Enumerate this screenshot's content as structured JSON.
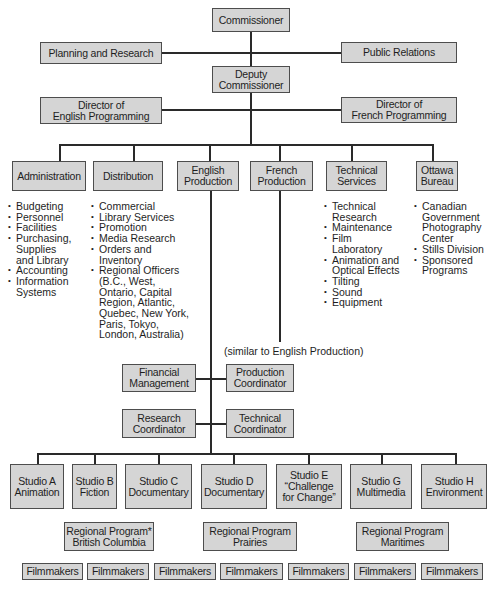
{
  "top": {
    "commissioner": "Commissioner",
    "planning": "Planning and Research",
    "public_relations": "Public Relations",
    "deputy": "Deputy\nCommissioner",
    "director_english": "Director of\nEnglish Programming",
    "director_french": "Director of\nFrench Programming"
  },
  "departments": [
    {
      "label": "Administration",
      "bullets": [
        "Budgeting",
        "Personnel",
        "Facilities",
        "Purchasing,\nSupplies\nand Library",
        "Accounting",
        "Information\nSystems"
      ]
    },
    {
      "label": "Distribution",
      "bullets": [
        "Commercial",
        "Library Services",
        "Promotion",
        "Media Research",
        "Orders and\nInventory",
        "Regional Officers\n(B.C., West,\nOntario, Capital\nRegion, Atlantic,\nQuebec, New York,\nParis, Tokyo,\nLondon, Australia)"
      ]
    },
    {
      "label": "English\nProduction",
      "bullets": []
    },
    {
      "label": "French\nProduction",
      "bullets": []
    },
    {
      "label": "Technical\nServices",
      "bullets": [
        "Technical\nResearch",
        "Maintenance",
        "Film\nLaboratory",
        "Animation and\nOptical Effects",
        "Tilting",
        "Sound",
        "Equipment"
      ]
    },
    {
      "label": "Ottawa\nBureau",
      "bullets": [
        "Canadian\nGovernment\nPhotography\nCenter",
        "Stills Division",
        "Sponsored\nPrograms"
      ]
    }
  ],
  "french_note": "(similar to English Production)",
  "english_staff": {
    "financial": "Financial\nManagement",
    "production_coord": "Production\nCoordinator",
    "research_coord": "Research\nCoordinator",
    "technical_coord": "Technical\nCoordinator"
  },
  "studios": [
    "Studio A\nAnimation",
    "Studio B\nFiction",
    "Studio C\nDocumentary",
    "Studio D\nDocumentary",
    "Studio E\n“Challenge\nfor Change”",
    "Studio G\nMultimedia",
    "Studio H\nEnvironment"
  ],
  "regional": [
    "Regional Program*\nBritish Columbia",
    "Regional Program\nPrairies",
    "Regional Program\nMaritimes"
  ],
  "filmmakers": [
    "Filmmakers",
    "Filmmakers",
    "Filmmakers",
    "Filmmakers",
    "Filmmakers",
    "Filmmakers",
    "Filmmakers"
  ],
  "colors": {
    "box_fill": "#d5d5d5",
    "box_border": "#4d4d4d",
    "line": "#2a2a2a"
  }
}
